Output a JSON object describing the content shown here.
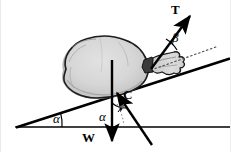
{
  "figure": {
    "type": "free-body-diagram",
    "canvas": {
      "width": 231,
      "height": 152,
      "background": "#ffffff"
    },
    "colors": {
      "line": "#000000",
      "sack_fill": "#d8d8d8",
      "sack_shade": "#b3b3b3",
      "sack_outline": "#1a1a1a",
      "dotted": "#555555",
      "frame_border": "#e9e9e9"
    },
    "labels": {
      "tension": "T",
      "beta": "β",
      "force_c": "C",
      "weight": "W",
      "alpha_incline": "α",
      "alpha_force": "α"
    },
    "geometry": {
      "ground_line": {
        "x1": 16,
        "y1": 127,
        "x2": 229,
        "y2": 127
      },
      "incline_line": {
        "x1": 16,
        "y1": 127,
        "x2": 229,
        "y2": 59
      },
      "incline_angle_deg": 18,
      "sack_contact_point": {
        "x": 113,
        "y": 96
      },
      "sack_neck_point": {
        "x": 152,
        "y": 68
      },
      "tension_vector": {
        "from_x": 152,
        "from_y": 68,
        "to_x": 194,
        "to_y": 12,
        "label": "T"
      },
      "tension_angle_from_incline": "β",
      "dotted_reference": {
        "x1": 152,
        "y1": 70,
        "x2": 214,
        "y2": 48
      },
      "weight_vector": {
        "from_x": 112,
        "from_y": 62,
        "to_x": 112,
        "to_y": 146,
        "label": "W"
      },
      "force_c_vector": {
        "from_x": 152,
        "from_y": 145,
        "to_x": 116,
        "to_y": 92,
        "label": "C"
      },
      "alpha_arc_incline": {
        "cx": 16,
        "cy": 127,
        "r": 42
      },
      "alpha_arc_force": {
        "cx": 112,
        "cy": 127,
        "r": 22
      }
    },
    "label_positions": {
      "tension": {
        "x": 171,
        "y": 4
      },
      "beta": {
        "x": 171,
        "y": 32
      },
      "force_c": {
        "x": 122,
        "y": 89
      },
      "weight": {
        "x": 83,
        "y": 132
      },
      "alpha_incline": {
        "x": 53,
        "y": 113
      },
      "alpha_force": {
        "x": 99,
        "y": 111
      }
    }
  }
}
